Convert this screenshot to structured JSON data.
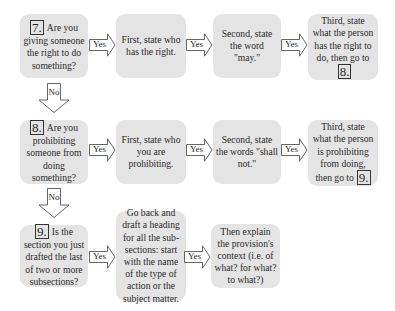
{
  "diagram": {
    "type": "flowchart",
    "colors": {
      "box_fill": "#e4e4e4",
      "arrow_stroke": "#555555",
      "text": "#2a2a2a",
      "background": "#ffffff"
    },
    "arrow_labels": {
      "yes": "Yes",
      "no": "No"
    },
    "rows": [
      {
        "question": {
          "number": "7.",
          "text": "Are you giving someone the right to do something?"
        },
        "steps": [
          {
            "text": "First, state who has the right."
          },
          {
            "text": "Second, state the word \"may.\""
          },
          {
            "text": "Third, state what the person has the right to do, then go to",
            "goto": "8."
          }
        ]
      },
      {
        "question": {
          "number": "8.",
          "text": "Are you prohibiting someone from doing something?"
        },
        "steps": [
          {
            "text": "First, state who you are prohibiting."
          },
          {
            "text": "Second, state the words \"shall not.\""
          },
          {
            "text": "Third, state what the person is prohibiting from doing, then go to",
            "goto": "9."
          }
        ]
      },
      {
        "question": {
          "number": "9.",
          "text": "Is the section you just drafted the last of two or more subsections?"
        },
        "steps": [
          {
            "text": "Go back and draft a heading for all the sub-sections: start with the name of the type of action or the subject matter."
          },
          {
            "text": "Then explain the provision's context (i.e. of what? for what? to what?)"
          }
        ]
      }
    ]
  }
}
